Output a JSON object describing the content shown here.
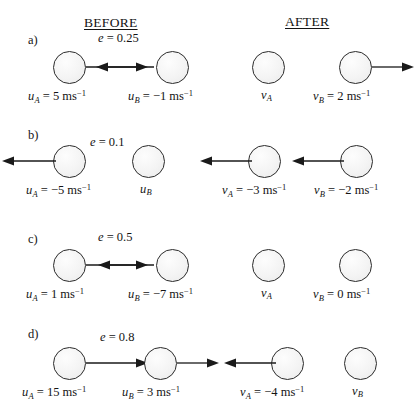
{
  "headers": {
    "before": "BEFORE",
    "after": "AFTER"
  },
  "rows": [
    {
      "label": "a)",
      "e_prefix": "e",
      "e_eq": " = 0.25",
      "e_text": "e = 0.25",
      "before": [
        {
          "sym": "u",
          "sub": "A",
          "eq": " = 5 ms",
          "sup": "−1",
          "full": "u_A = 5 ms⁻¹",
          "direction": "right"
        },
        {
          "sym": "u",
          "sub": "B",
          "eq": " = −1 ms",
          "sup": "−1",
          "full": "u_B = −1 ms⁻¹",
          "direction": "left"
        }
      ],
      "after": [
        {
          "sym": "v",
          "sub": "A",
          "eq": "",
          "sup": "",
          "full": "v_A",
          "direction": "none"
        },
        {
          "sym": "v",
          "sub": "B",
          "eq": " = 2 ms",
          "sup": "−1",
          "full": "v_B = 2 ms⁻¹",
          "direction": "right"
        }
      ]
    },
    {
      "label": "b)",
      "e_prefix": "e",
      "e_eq": " = 0.1",
      "e_text": "e = 0.1",
      "before": [
        {
          "sym": "u",
          "sub": "A",
          "eq": " = −5 ms",
          "sup": "−1",
          "full": "u_A = −5 ms⁻¹",
          "direction": "left"
        },
        {
          "sym": "u",
          "sub": "B",
          "eq": "",
          "sup": "",
          "full": "u_B",
          "direction": "none"
        }
      ],
      "after": [
        {
          "sym": "v",
          "sub": "A",
          "eq": " = −3 ms",
          "sup": "−1",
          "full": "v_A = −3 ms⁻¹",
          "direction": "left"
        },
        {
          "sym": "v",
          "sub": "B",
          "eq": " = −2 ms",
          "sup": "−1",
          "full": "v_B = −2 ms⁻¹",
          "direction": "left"
        }
      ]
    },
    {
      "label": "c)",
      "e_prefix": "e",
      "e_eq": " = 0.5",
      "e_text": "e = 0.5",
      "before": [
        {
          "sym": "u",
          "sub": "A",
          "eq": " = 1 ms",
          "sup": "−1",
          "full": "u_A = 1 ms⁻¹",
          "direction": "right"
        },
        {
          "sym": "u",
          "sub": "B",
          "eq": " = −7 ms",
          "sup": "−1",
          "full": "u_B = −7 ms⁻¹",
          "direction": "left"
        }
      ],
      "after": [
        {
          "sym": "v",
          "sub": "A",
          "eq": "",
          "sup": "",
          "full": "v_A",
          "direction": "none"
        },
        {
          "sym": "v",
          "sub": "B",
          "eq": " = 0 ms",
          "sup": "−1",
          "full": "v_B = 0 ms⁻¹",
          "direction": "none"
        }
      ]
    },
    {
      "label": "d)",
      "e_prefix": "e",
      "e_eq": " = 0.8",
      "e_text": "e = 0.8",
      "before": [
        {
          "sym": "u",
          "sub": "A",
          "eq": " = 15 ms",
          "sup": "−1",
          "full": "u_A = 15 ms⁻¹",
          "direction": "right"
        },
        {
          "sym": "u",
          "sub": "B",
          "eq": " = 3 ms",
          "sup": "−1",
          "full": "u_B = 3 ms⁻¹",
          "direction": "right"
        }
      ],
      "after": [
        {
          "sym": "v",
          "sub": "A",
          "eq": " = −4 ms",
          "sup": "−1",
          "full": "v_A = −4 ms⁻¹",
          "direction": "left"
        },
        {
          "sym": "v",
          "sub": "B",
          "eq": "",
          "sup": "",
          "full": "v_B",
          "direction": "none"
        }
      ]
    }
  ],
  "colors": {
    "background": "#ffffff",
    "ink": "#141414",
    "ball_outline": "#2b2b2b",
    "ball_fill": "#f4f4f4",
    "arrow": "#1a1a1a"
  }
}
